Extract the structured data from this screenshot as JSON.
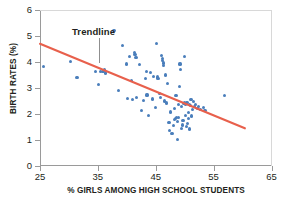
{
  "chart_data": {
    "type": "scatter",
    "title": "",
    "xlabel": "% GIRLS AMONG HIGH SCHOOL STUDENTS",
    "ylabel": "BIRTH RATES (%)",
    "xlim": [
      25,
      65
    ],
    "ylim": [
      0,
      6
    ],
    "xticks": [
      "25",
      "35",
      "45",
      "55",
      "65"
    ],
    "xtick_values": [
      25,
      35,
      45,
      55,
      65
    ],
    "yticks": [
      "0",
      "1",
      "2",
      "3",
      "4",
      "5",
      "6"
    ],
    "ytick_values": [
      0,
      1,
      2,
      3,
      4,
      5,
      6
    ],
    "grid": false,
    "legend": "none",
    "annotations": [
      {
        "text": "Trendline",
        "x": 34.5,
        "y": 5.15,
        "points_to_x": 35.2,
        "points_to_y": 3.95
      }
    ],
    "series": [
      {
        "name": "countries",
        "type": "scatter",
        "color": "#4a7ebb",
        "marker": "circle",
        "points": [
          [
            25.6,
            3.82
          ],
          [
            30.3,
            4.03
          ],
          [
            31.4,
            3.4
          ],
          [
            34.6,
            3.62
          ],
          [
            35.1,
            3.15
          ],
          [
            35.4,
            3.62
          ],
          [
            35.9,
            3.64
          ],
          [
            36.2,
            3.7
          ],
          [
            36.3,
            3.58
          ],
          [
            37.8,
            5.21
          ],
          [
            38.6,
            2.9
          ],
          [
            39.3,
            4.63
          ],
          [
            39.9,
            3.92
          ],
          [
            40.1,
            2.6
          ],
          [
            40.5,
            4.22
          ],
          [
            40.8,
            3.28
          ],
          [
            41.0,
            2.55
          ],
          [
            41.3,
            4.38
          ],
          [
            41.4,
            4.3
          ],
          [
            41.6,
            4.18
          ],
          [
            41.7,
            2.62
          ],
          [
            42.2,
            3.9
          ],
          [
            42.6,
            2.12
          ],
          [
            42.9,
            2.52
          ],
          [
            43.2,
            3.38
          ],
          [
            43.4,
            3.62
          ],
          [
            43.5,
            2.73
          ],
          [
            43.8,
            1.95
          ],
          [
            44.1,
            3.61
          ],
          [
            44.4,
            2.58
          ],
          [
            44.6,
            3.45
          ],
          [
            44.9,
            2.25
          ],
          [
            45.2,
            4.72
          ],
          [
            45.3,
            3.42
          ],
          [
            45.4,
            3.35
          ],
          [
            45.6,
            2.78
          ],
          [
            45.8,
            2.62
          ],
          [
            46.0,
            4.25
          ],
          [
            46.1,
            4.12
          ],
          [
            46.2,
            4.05
          ],
          [
            46.3,
            3.96
          ],
          [
            46.4,
            3.88
          ],
          [
            46.5,
            2.5
          ],
          [
            46.7,
            3.5
          ],
          [
            46.9,
            2.42
          ],
          [
            47.1,
            3.18
          ],
          [
            47.3,
            1.68
          ],
          [
            47.4,
            1.38
          ],
          [
            47.6,
            2.08
          ],
          [
            47.8,
            1.25
          ],
          [
            48.0,
            1.55
          ],
          [
            48.2,
            2.22
          ],
          [
            48.3,
            1.78
          ],
          [
            48.4,
            1.82
          ],
          [
            48.5,
            2.7
          ],
          [
            48.6,
            1.85
          ],
          [
            48.7,
            1.72
          ],
          [
            48.8,
            1.02
          ],
          [
            48.9,
            2.35
          ],
          [
            49.0,
            1.88
          ],
          [
            49.1,
            3.05
          ],
          [
            49.2,
            3.92
          ],
          [
            49.3,
            3.72
          ],
          [
            49.4,
            2.28
          ],
          [
            49.5,
            1.45
          ],
          [
            49.6,
            1.58
          ],
          [
            49.7,
            1.75
          ],
          [
            49.8,
            2.4
          ],
          [
            49.9,
            4.22
          ],
          [
            50.0,
            2.42
          ],
          [
            50.1,
            1.95
          ],
          [
            50.2,
            2.38
          ],
          [
            50.3,
            1.52
          ],
          [
            50.4,
            2.45
          ],
          [
            50.5,
            1.62
          ],
          [
            50.6,
            2.05
          ],
          [
            50.7,
            1.82
          ],
          [
            50.8,
            2.35
          ],
          [
            50.9,
            1.42
          ],
          [
            51.0,
            2.32
          ],
          [
            51.1,
            2.55
          ],
          [
            51.2,
            1.92
          ],
          [
            51.3,
            2.18
          ],
          [
            51.5,
            2.48
          ],
          [
            51.7,
            2.28
          ],
          [
            51.9,
            2.38
          ],
          [
            52.2,
            2.22
          ],
          [
            52.4,
            2.3
          ],
          [
            52.8,
            2.18
          ],
          [
            53.2,
            2.25
          ],
          [
            53.4,
            2.12
          ],
          [
            53.6,
            2.15
          ],
          [
            56.9,
            2.72
          ]
        ]
      },
      {
        "name": "Trendline",
        "type": "line",
        "color": "#e8604c",
        "x_start": 25.0,
        "y_start": 4.7,
        "x_end": 60.4,
        "y_end": 1.45
      }
    ]
  }
}
